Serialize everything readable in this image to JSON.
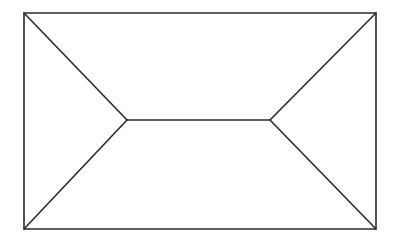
{
  "diagram": {
    "type": "hip-roof-plan",
    "stroke_color": "#2a2a2a",
    "background": "#ffffff",
    "outline": {
      "x1": 24,
      "y1": 13,
      "x2": 376,
      "y2": 229
    },
    "ridge": {
      "x1": 127,
      "y1": 120,
      "x2": 270,
      "y2": 120
    },
    "hips": [
      {
        "from": [
          24,
          13
        ],
        "to": [
          127,
          120
        ]
      },
      {
        "from": [
          24,
          229
        ],
        "to": [
          127,
          120
        ]
      },
      {
        "from": [
          376,
          13
        ],
        "to": [
          270,
          120
        ]
      },
      {
        "from": [
          376,
          229
        ],
        "to": [
          270,
          120
        ]
      }
    ]
  }
}
